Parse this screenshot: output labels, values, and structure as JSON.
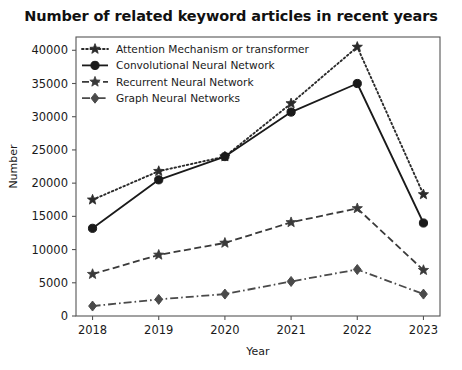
{
  "chart_data": {
    "type": "line",
    "title": "Number of related keyword articles in recent years",
    "xlabel": "Year",
    "ylabel": "Number",
    "categories": [
      "2018",
      "2019",
      "2020",
      "2021",
      "2022",
      "2023"
    ],
    "x": [
      2018,
      2019,
      2020,
      2021,
      2022,
      2023
    ],
    "xlim": [
      2017.75,
      2023.25
    ],
    "ylim": [
      0,
      42000
    ],
    "yticks": [
      0,
      5000,
      10000,
      15000,
      20000,
      25000,
      30000,
      35000,
      40000
    ],
    "ytick_labels": [
      "0",
      "5000",
      "10000",
      "15000",
      "20000",
      "25000",
      "30000",
      "35000",
      "40000"
    ],
    "grid": false,
    "legend_position": "upper left",
    "series": [
      {
        "name": "Attention Mechanism or transformer",
        "values": [
          17500,
          21800,
          24000,
          32000,
          40500,
          18300
        ],
        "color": "#2b2b2b",
        "linestyle": "dotted",
        "marker": "star"
      },
      {
        "name": "Convolutional Neural Network",
        "values": [
          13200,
          20500,
          24000,
          30700,
          35000,
          14000
        ],
        "color": "#1a1a1a",
        "linestyle": "solid",
        "marker": "circle"
      },
      {
        "name": "Recurrent Neural Network",
        "values": [
          6300,
          9200,
          11000,
          14100,
          16200,
          6900
        ],
        "color": "#3a3a3a",
        "linestyle": "dashed",
        "marker": "star"
      },
      {
        "name": "Graph Neural Networks",
        "values": [
          1500,
          2500,
          3300,
          5200,
          7000,
          3300
        ],
        "color": "#4a4a4a",
        "linestyle": "dashdot",
        "marker": "diamond"
      }
    ]
  },
  "legend": {
    "items": [
      {
        "label": "Attention Mechanism or transformer"
      },
      {
        "label": "Convolutional Neural Network"
      },
      {
        "label": "Recurrent Neural Network"
      },
      {
        "label": "Graph Neural Networks"
      }
    ]
  }
}
